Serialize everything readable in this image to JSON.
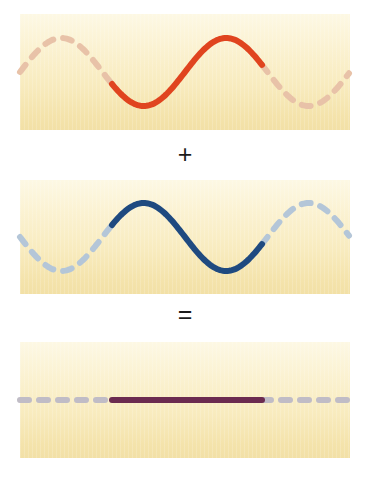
{
  "figure": {
    "background_color": "#ffffff"
  },
  "operators": {
    "plus": "+",
    "equals": "="
  },
  "panels": [
    {
      "id": "panel-wave-1",
      "name": "wave-panel-red",
      "label": "Wave 1",
      "background_start": "#fdf8e4",
      "background_end": "#f2e0a6",
      "solid_color": "#e0441f",
      "dashed_color": "#e8c2a8",
      "stroke_width": 6,
      "wave": {
        "type": "sine",
        "amplitude": 34,
        "wavelength": 165,
        "phase_deg": 0,
        "baseline_y": 58,
        "solid_start_x": 92,
        "solid_end_x": 242
      }
    },
    {
      "id": "panel-wave-2",
      "name": "wave-panel-blue",
      "label": "Wave 2",
      "background_start": "#fdf8e4",
      "background_end": "#f2e0a6",
      "solid_color": "#1f4a80",
      "dashed_color": "#b4c6d8",
      "stroke_width": 6,
      "wave": {
        "type": "sine",
        "amplitude": 34,
        "wavelength": 165,
        "phase_deg": 180,
        "baseline_y": 57,
        "solid_start_x": 92,
        "solid_end_x": 242
      }
    },
    {
      "id": "panel-wave-3",
      "name": "wave-panel-result",
      "label": "Resultant",
      "background_start": "#fdf8e4",
      "background_end": "#f2e0a6",
      "solid_color": "#6b2b50",
      "dashed_color": "#c0bcc6",
      "stroke_width": 6,
      "wave": {
        "type": "flat",
        "amplitude": 0,
        "wavelength": 165,
        "phase_deg": 0,
        "baseline_y": 58,
        "solid_start_x": 92,
        "solid_end_x": 242
      }
    }
  ]
}
